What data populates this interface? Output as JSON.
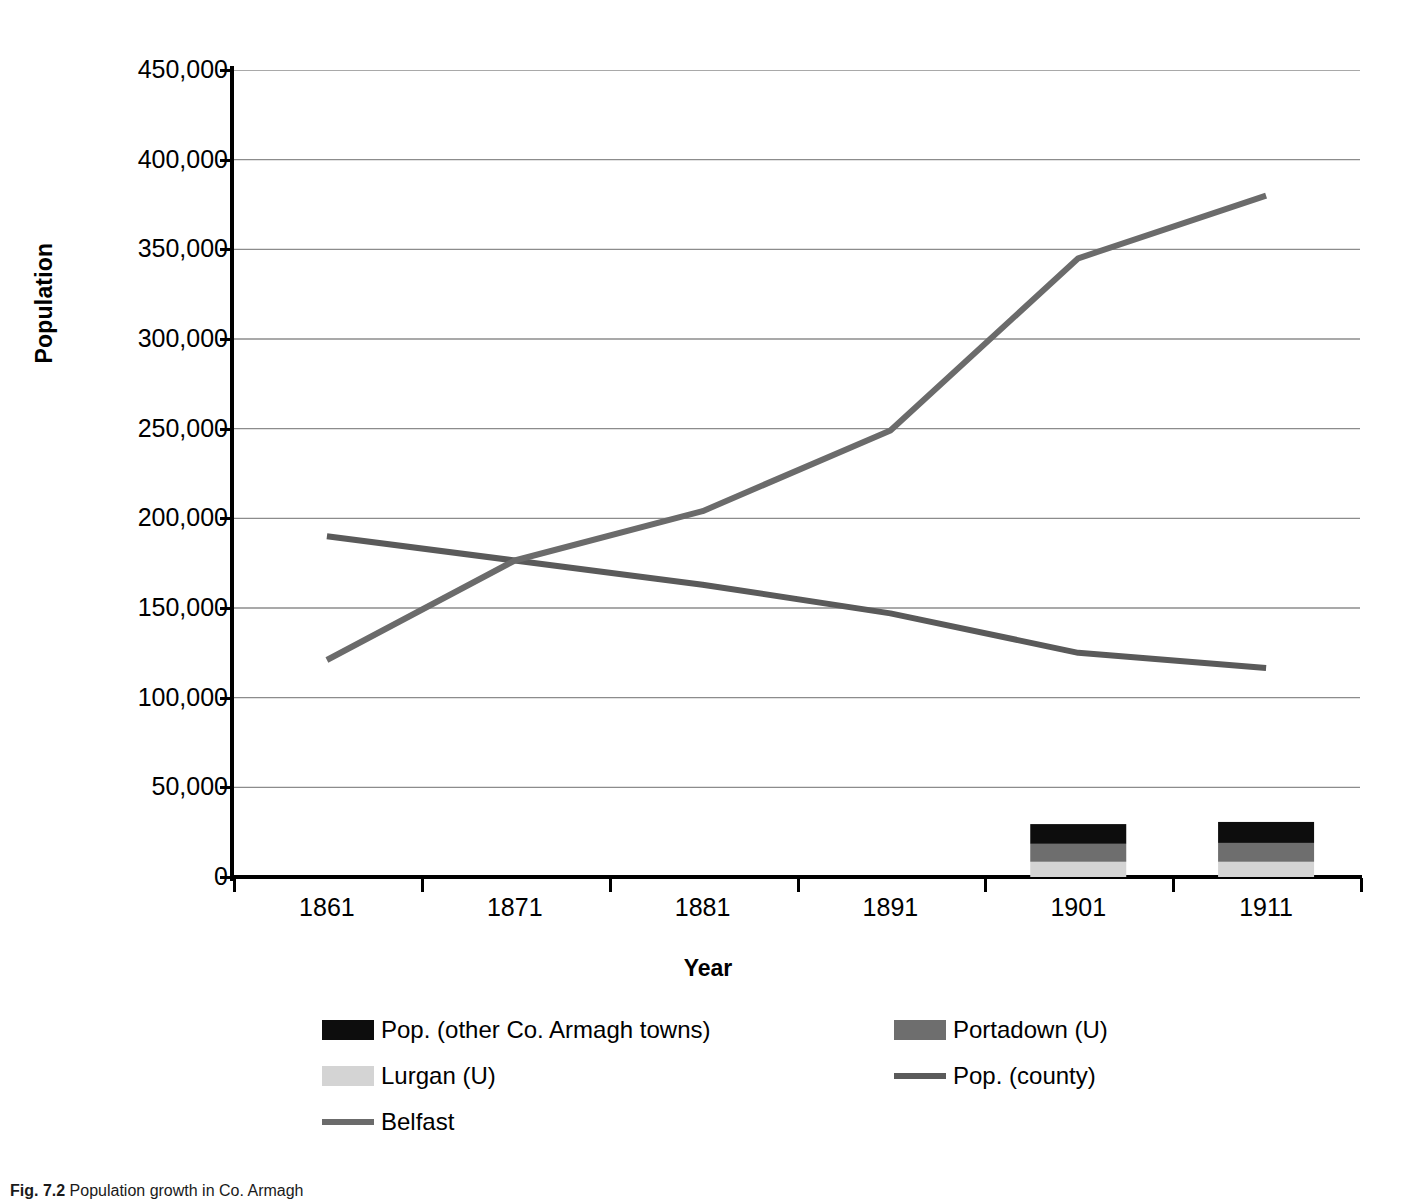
{
  "figure": {
    "caption": "Fig. 7.2",
    "caption_rest": "  Population growth in Co. Armagh"
  },
  "axes": {
    "y_title": "Population",
    "x_title": "Year",
    "y_ticks": [
      "0",
      "50,000",
      "100,000",
      "150,000",
      "200,000",
      "250,000",
      "300,000",
      "350,000",
      "400,000",
      "450,000"
    ],
    "x_ticks": [
      "1861",
      "1871",
      "1881",
      "1891",
      "1901",
      "1911"
    ]
  },
  "legend": {
    "items": [
      {
        "label": "Pop. (other Co. Armagh towns)",
        "marker": "box",
        "color": "#0d0d0d",
        "col": 0,
        "row": 0
      },
      {
        "label": "Portadown (U)",
        "marker": "box",
        "color": "#6e6e6e",
        "col": 1,
        "row": 0
      },
      {
        "label": "Lurgan (U)",
        "marker": "box",
        "color": "#d4d4d4",
        "col": 0,
        "row": 1
      },
      {
        "label": "Pop. (county)",
        "marker": "line",
        "color": "#5a5a5a",
        "col": 1,
        "row": 1
      },
      {
        "label": "Belfast",
        "marker": "line",
        "color": "#6b6b6b",
        "col": 0,
        "row": 2
      }
    ]
  },
  "colors": {
    "other_towns": "#0d0d0d",
    "portadown": "#6e6e6e",
    "lurgan": "#d4d4d4",
    "pop_county": "#5a5a5a",
    "belfast": "#6b6b6b",
    "gridline": "#8c8c8c",
    "axis": "#000000"
  },
  "chart_data": {
    "type": "line",
    "title": "",
    "xlabel": "Year",
    "ylabel": "Population",
    "categories": [
      "1861",
      "1871",
      "1881",
      "1891",
      "1901",
      "1911"
    ],
    "ylim": [
      0,
      450000
    ],
    "ytick_step": 50000,
    "grid": true,
    "legend_position": "bottom",
    "series": [
      {
        "name": "Pop. (county)",
        "type": "line",
        "color": "#5a5a5a",
        "values": [
          190000,
          176500,
          163000,
          147000,
          125000,
          116500
        ]
      },
      {
        "name": "Belfast",
        "type": "line",
        "color": "#6b6b6b",
        "values": [
          121000,
          176500,
          204000,
          249000,
          345000,
          380000
        ]
      },
      {
        "name": "Lurgan (U)",
        "type": "bar-stacked",
        "color": "#d4d4d4",
        "values": [
          null,
          null,
          null,
          null,
          8500,
          8500
        ]
      },
      {
        "name": "Portadown (U)",
        "type": "bar-stacked",
        "color": "#6e6e6e",
        "values": [
          null,
          null,
          null,
          null,
          10000,
          10500
        ]
      },
      {
        "name": "Pop. (other Co. Armagh towns)",
        "type": "bar-stacked",
        "color": "#0d0d0d",
        "values": [
          null,
          null,
          null,
          null,
          11000,
          11700
        ]
      }
    ]
  }
}
